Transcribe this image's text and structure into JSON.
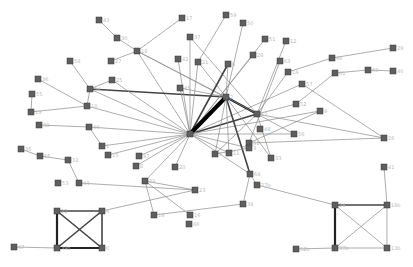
{
  "diagram": {
    "type": "network-graph",
    "node_size": 6,
    "colors": {
      "node": "#5f5f5f",
      "edge": "#8a8a8a",
      "edge_heavy": "#000000",
      "label": "#b8b8b8"
    },
    "nodes": [
      {
        "id": "n1",
        "label": "43",
        "x": 99,
        "y": 20
      },
      {
        "id": "n2",
        "label": "30",
        "x": 117,
        "y": 38
      },
      {
        "id": "n3",
        "label": "18",
        "x": 137,
        "y": 51
      },
      {
        "id": "n4",
        "label": "17",
        "x": 182,
        "y": 18
      },
      {
        "id": "n5",
        "label": "58",
        "x": 70,
        "y": 61
      },
      {
        "id": "n6",
        "label": "27",
        "x": 111,
        "y": 61
      },
      {
        "id": "n7",
        "label": "37",
        "x": 190,
        "y": 37
      },
      {
        "id": "n8",
        "label": "36",
        "x": 38,
        "y": 79
      },
      {
        "id": "n9",
        "label": "25",
        "x": 112,
        "y": 80
      },
      {
        "id": "n10",
        "label": "42",
        "x": 178,
        "y": 59
      },
      {
        "id": "n11",
        "label": "21",
        "x": 198,
        "y": 62
      },
      {
        "id": "n12",
        "label": "59",
        "x": 226,
        "y": 15
      },
      {
        "id": "n13",
        "label": "50",
        "x": 243,
        "y": 23
      },
      {
        "id": "n14",
        "label": "51",
        "x": 265,
        "y": 39
      },
      {
        "id": "n15",
        "label": "12",
        "x": 286,
        "y": 41
      },
      {
        "id": "n16",
        "label": "28",
        "x": 253,
        "y": 55
      },
      {
        "id": "n17",
        "label": "63",
        "x": 280,
        "y": 61
      },
      {
        "id": "n18",
        "label": "6",
        "x": 228,
        "y": 64
      },
      {
        "id": "n19",
        "label": "46",
        "x": 332,
        "y": 58
      },
      {
        "id": "n20",
        "label": "14",
        "x": 288,
        "y": 72
      },
      {
        "id": "n21",
        "label": "29",
        "x": 393,
        "y": 48
      },
      {
        "id": "n22",
        "label": "61",
        "x": 335,
        "y": 73
      },
      {
        "id": "n23",
        "label": "57",
        "x": 302,
        "y": 84
      },
      {
        "id": "n24",
        "label": "60",
        "x": 368,
        "y": 70
      },
      {
        "id": "n25",
        "label": "40",
        "x": 393,
        "y": 71
      },
      {
        "id": "n26",
        "label": "54",
        "x": 90,
        "y": 89
      },
      {
        "id": "n27",
        "label": "55",
        "x": 32,
        "y": 94
      },
      {
        "id": "n28",
        "label": "10",
        "x": 87,
        "y": 106
      },
      {
        "id": "n29",
        "label": "13",
        "x": 31,
        "y": 112
      },
      {
        "id": "n30",
        "label": "45",
        "x": 180,
        "y": 88
      },
      {
        "id": "n31",
        "label": "2",
        "x": 226,
        "y": 97
      },
      {
        "id": "n32",
        "label": "62",
        "x": 257,
        "y": 114
      },
      {
        "id": "n33",
        "label": "52",
        "x": 296,
        "y": 104
      },
      {
        "id": "n34",
        "label": "48",
        "x": 260,
        "y": 129
      },
      {
        "id": "n35",
        "label": "9",
        "x": 320,
        "y": 111
      },
      {
        "id": "n36",
        "label": "5",
        "x": 190,
        "y": 134
      },
      {
        "id": "n37",
        "label": "39",
        "x": 39,
        "y": 125
      },
      {
        "id": "n38",
        "label": "49",
        "x": 89,
        "y": 127
      },
      {
        "id": "n39",
        "label": "56",
        "x": 294,
        "y": 134
      },
      {
        "id": "n40",
        "label": "26",
        "x": 384,
        "y": 138
      },
      {
        "id": "n41",
        "label": "31",
        "x": 249,
        "y": 143
      },
      {
        "id": "n42",
        "label": "7",
        "x": 215,
        "y": 154
      },
      {
        "id": "n43",
        "label": "33",
        "x": 271,
        "y": 158
      },
      {
        "id": "n44",
        "label": "35",
        "x": 21,
        "y": 149
      },
      {
        "id": "n45",
        "label": "1",
        "x": 102,
        "y": 146
      },
      {
        "id": "n46",
        "label": "65",
        "x": 40,
        "y": 156
      },
      {
        "id": "n47",
        "label": "32",
        "x": 68,
        "y": 160
      },
      {
        "id": "n48",
        "label": "15",
        "x": 108,
        "y": 155
      },
      {
        "id": "n49",
        "label": "47",
        "x": 139,
        "y": 156
      },
      {
        "id": "n50",
        "label": "8",
        "x": 136,
        "y": 166
      },
      {
        "id": "n51",
        "label": "20",
        "x": 175,
        "y": 167
      },
      {
        "id": "n52",
        "label": "11",
        "x": 229,
        "y": 153
      },
      {
        "id": "n53",
        "label": "3",
        "x": 249,
        "y": 148
      },
      {
        "id": "n54",
        "label": "23",
        "x": 195,
        "y": 190
      },
      {
        "id": "n55",
        "label": "44",
        "x": 79,
        "y": 183
      },
      {
        "id": "n56",
        "label": "34",
        "x": 145,
        "y": 181
      },
      {
        "id": "n57",
        "label": "64",
        "x": 250,
        "y": 174
      },
      {
        "id": "n58",
        "label": "41",
        "x": 384,
        "y": 167
      },
      {
        "id": "n59",
        "label": "53",
        "x": 58,
        "y": 183
      },
      {
        "id": "n60",
        "label": "19",
        "x": 154,
        "y": 215
      },
      {
        "id": "n61",
        "label": "16",
        "x": 190,
        "y": 215
      },
      {
        "id": "n62",
        "label": "38",
        "x": 243,
        "y": 204
      },
      {
        "id": "n63",
        "label": "66",
        "x": 189,
        "y": 224
      },
      {
        "id": "n64",
        "label": "22",
        "x": 57,
        "y": 211
      },
      {
        "id": "n65",
        "label": "4",
        "x": 102,
        "y": 211
      },
      {
        "id": "n66",
        "label": "27b",
        "x": 257,
        "y": 185
      },
      {
        "id": "n67",
        "label": "24",
        "x": 335,
        "y": 205
      },
      {
        "id": "n68",
        "label": "18b",
        "x": 387,
        "y": 205
      },
      {
        "id": "n69",
        "label": "67",
        "x": 14,
        "y": 247
      },
      {
        "id": "n70",
        "label": "39b",
        "x": 57,
        "y": 248
      },
      {
        "id": "n71",
        "label": "0",
        "x": 102,
        "y": 248
      },
      {
        "id": "n72",
        "label": "52b",
        "x": 296,
        "y": 249
      },
      {
        "id": "n73",
        "label": "37b",
        "x": 335,
        "y": 248
      },
      {
        "id": "n74",
        "label": "13b",
        "x": 387,
        "y": 248
      }
    ],
    "hubs": {
      "center": [
        190,
        134
      ],
      "upper": [
        228,
        97
      ],
      "right": [
        257,
        114
      ]
    },
    "edges": [
      [
        "n1",
        "n2",
        1
      ],
      [
        "n2",
        "n3",
        1
      ],
      [
        "n3",
        "n4",
        1
      ],
      [
        "n3",
        "n6",
        1
      ],
      [
        "n3",
        "n36",
        1
      ],
      [
        "n3",
        "n32",
        1
      ],
      [
        "n3",
        "n31",
        1
      ],
      [
        "n5",
        "n26",
        1
      ],
      [
        "n26",
        "n36",
        1
      ],
      [
        "n26",
        "n31",
        2
      ],
      [
        "n26",
        "n28",
        1
      ],
      [
        "n9",
        "n36",
        1
      ],
      [
        "n9",
        "n26",
        1
      ],
      [
        "n7",
        "n36",
        1
      ],
      [
        "n7",
        "n32",
        1
      ],
      [
        "n10",
        "n36",
        1
      ],
      [
        "n11",
        "n36",
        1
      ],
      [
        "n11",
        "n31",
        1
      ],
      [
        "n12",
        "n11",
        1
      ],
      [
        "n13",
        "n31",
        1
      ],
      [
        "n14",
        "n36",
        1
      ],
      [
        "n15",
        "n32",
        1
      ],
      [
        "n16",
        "n36",
        1
      ],
      [
        "n17",
        "n41",
        1
      ],
      [
        "n18",
        "n36",
        2
      ],
      [
        "n18",
        "n31",
        1
      ],
      [
        "n19",
        "n20",
        1
      ],
      [
        "n20",
        "n32",
        1
      ],
      [
        "n21",
        "n19",
        1
      ],
      [
        "n22",
        "n33",
        1
      ],
      [
        "n24",
        "n22",
        1
      ],
      [
        "n24",
        "n25",
        1
      ],
      [
        "n23",
        "n36",
        1
      ],
      [
        "n23",
        "n40",
        1
      ],
      [
        "n33",
        "n32",
        1
      ],
      [
        "n32",
        "n40",
        1
      ],
      [
        "n35",
        "n36",
        1
      ],
      [
        "n35",
        "n41",
        1
      ],
      [
        "n41",
        "n40",
        1
      ],
      [
        "n27",
        "n29",
        1
      ],
      [
        "n28",
        "n36",
        1
      ],
      [
        "n8",
        "n28",
        1
      ],
      [
        "n29",
        "n28",
        1
      ],
      [
        "n37",
        "n38",
        1
      ],
      [
        "n38",
        "n36",
        1
      ],
      [
        "n38",
        "n45",
        1
      ],
      [
        "n44",
        "n46",
        1
      ],
      [
        "n46",
        "n47",
        1
      ],
      [
        "n47",
        "n55",
        1
      ],
      [
        "n55",
        "n54",
        1
      ],
      [
        "n45",
        "n36",
        1
      ],
      [
        "n48",
        "n36",
        1
      ],
      [
        "n49",
        "n36",
        1
      ],
      [
        "n30",
        "n36",
        1
      ],
      [
        "n30",
        "n31",
        1
      ],
      [
        "n31",
        "n36",
        5
      ],
      [
        "n31",
        "n32",
        3
      ],
      [
        "n36",
        "n32",
        2
      ],
      [
        "n36",
        "n52",
        1
      ],
      [
        "n36",
        "n50",
        1
      ],
      [
        "n36",
        "n51",
        1
      ],
      [
        "n36",
        "n53",
        1
      ],
      [
        "n36",
        "n39",
        1
      ],
      [
        "n36",
        "n57",
        1
      ],
      [
        "n31",
        "n57",
        2
      ],
      [
        "n31",
        "n52",
        1
      ],
      [
        "n31",
        "n42",
        1
      ],
      [
        "n31",
        "n43",
        1
      ],
      [
        "n31",
        "n39",
        1
      ],
      [
        "n32",
        "n43",
        1
      ],
      [
        "n32",
        "n42",
        1
      ],
      [
        "n36",
        "n56",
        1
      ],
      [
        "n56",
        "n54",
        1
      ],
      [
        "n54",
        "n65",
        1
      ],
      [
        "n56",
        "n60",
        1
      ],
      [
        "n56",
        "n61",
        1
      ],
      [
        "n57",
        "n66",
        1
      ],
      [
        "n57",
        "n62",
        1
      ],
      [
        "n62",
        "n60",
        1
      ],
      [
        "n66",
        "n67",
        1
      ],
      [
        "n53",
        "n42",
        1
      ],
      [
        "n64",
        "n65",
        2
      ],
      [
        "n64",
        "n70",
        3
      ],
      [
        "n64",
        "n71",
        2
      ],
      [
        "n65",
        "n70",
        2
      ],
      [
        "n65",
        "n71",
        2
      ],
      [
        "n70",
        "n71",
        3
      ],
      [
        "n69",
        "n70",
        1
      ],
      [
        "n67",
        "n68",
        2
      ],
      [
        "n67",
        "n73",
        3
      ],
      [
        "n67",
        "n74",
        1
      ],
      [
        "n68",
        "n73",
        1
      ],
      [
        "n68",
        "n74",
        1
      ],
      [
        "n73",
        "n74",
        1
      ],
      [
        "n72",
        "n73",
        1
      ],
      [
        "n58",
        "n68",
        1
      ]
    ]
  }
}
